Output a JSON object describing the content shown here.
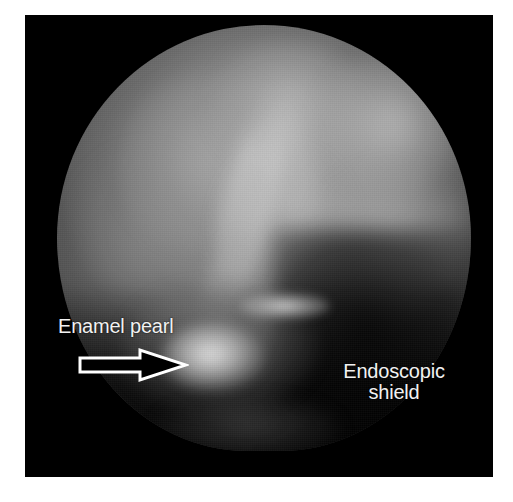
{
  "figure": {
    "kind": "endoscopic-photograph",
    "modality": "dental endoscopy",
    "background_color": "#ffffff",
    "frame_color": "#000000",
    "frame": {
      "x": 25,
      "y": 15,
      "width": 468,
      "height": 462
    }
  },
  "annotations": {
    "enamel_pearl": {
      "label": "Enamel pearl",
      "color": "#f2f2f2",
      "x": 33,
      "y": 301
    },
    "endoscopic_shield": {
      "label_line1": "Endoscopic",
      "label_line2": "shield",
      "color": "#f2f2f2",
      "x": 310,
      "y": 346
    },
    "pointer": {
      "icon": "arrow-right-outline-icon",
      "direction": "right",
      "stroke_color": "#ffffff",
      "fill_color": "#000000",
      "x": 52,
      "y": 332,
      "width": 112,
      "height": 36
    }
  },
  "field_of_view": {
    "shape": "circular",
    "x": 57,
    "y": 25,
    "width": 414,
    "height": 426,
    "tissue_tone": "#8d8d8d",
    "shadow_tone": "#000000",
    "pearl_highlight_tone": "#ececec"
  },
  "caption": {
    "visible_fragment": "cropped partial caption line",
    "text": ""
  }
}
